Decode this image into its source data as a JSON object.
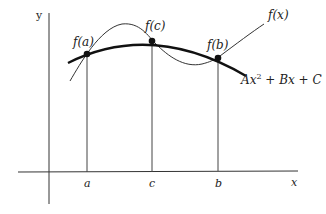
{
  "diagram": {
    "axes": {
      "x_label": "x",
      "y_label": "y"
    },
    "ticks": [
      {
        "label": "a",
        "x": 87
      },
      {
        "label": "c",
        "x": 152
      },
      {
        "label": "b",
        "x": 218
      }
    ],
    "points": [
      {
        "label": "f(a)",
        "x": 87,
        "y": 54
      },
      {
        "label": "f(c)",
        "x": 152,
        "y": 41
      },
      {
        "label": "f(b)",
        "x": 218,
        "y": 58
      }
    ],
    "curves": {
      "function_label": "f(x)",
      "parabola_label_parts": [
        "Ax",
        "2",
        " + Bx + C"
      ]
    },
    "colors": {
      "ink": "#222222",
      "background": "#ffffff"
    }
  }
}
